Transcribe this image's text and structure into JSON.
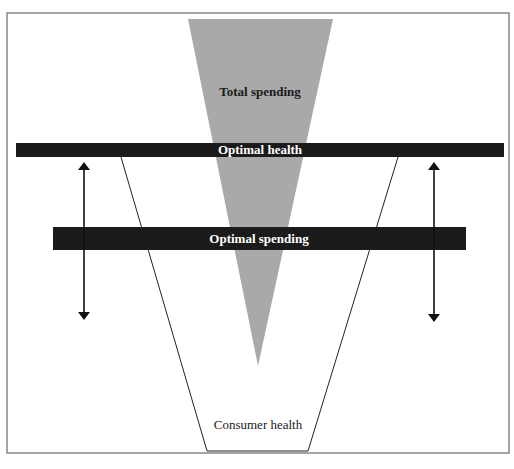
{
  "diagram": {
    "labels": {
      "total_spending": "Total spending",
      "optimal_health": "Optimal health",
      "optimal_spending": "Optimal spending",
      "consumer_health": "Consumer health"
    },
    "colors": {
      "frame": "#6a6a6a",
      "spending_funnel": "#a9a9a9",
      "bar": "#1b1b1b",
      "outline": "#222222",
      "arrow": "#111111",
      "background": "#ffffff"
    },
    "shapes": {
      "spending_funnel": "inverted-triangle",
      "health_funnel": "trapezoid-outline",
      "arrows": [
        "double-headed-vertical-left",
        "double-headed-vertical-right"
      ]
    }
  }
}
